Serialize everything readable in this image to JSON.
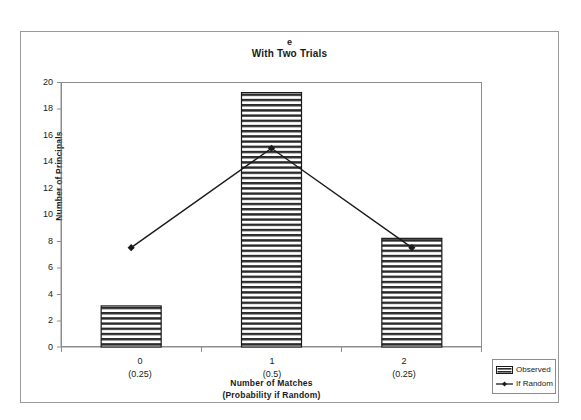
{
  "chart_data": {
    "type": "bar",
    "title": "With Two Trials",
    "panel_label": "e",
    "xlabel": "Number of Matches",
    "xlabel_sub": "(Probability if Random)",
    "ylabel": "Number of Principals",
    "ylim": [
      0,
      20
    ],
    "ytick_step": 2,
    "yticks": [
      0,
      2,
      4,
      6,
      8,
      10,
      12,
      14,
      16,
      18,
      20
    ],
    "grid": false,
    "legend_position": "bottom-right-outside",
    "categories": [
      "0",
      "1",
      "2"
    ],
    "category_sublabels": [
      "(0.25)",
      "(0.5)",
      "(0.25)"
    ],
    "series": [
      {
        "name": "Observed",
        "type": "bar",
        "fill": "horizontal-hatch",
        "values": [
          3.1,
          19.2,
          8.2
        ]
      },
      {
        "name": "If Random",
        "type": "line",
        "marker": "diamond",
        "color": "#1a1a1a",
        "values": [
          7.5,
          15.0,
          7.5
        ]
      }
    ]
  },
  "legend": {
    "items": [
      {
        "label": "Observed",
        "swatch": "hatched-bar-swatch"
      },
      {
        "label": "If Random",
        "swatch": "line-marker-swatch"
      }
    ]
  },
  "colors": {
    "bar_stroke": "#1a1a1a",
    "bar_fill": "#ffffff",
    "hatch": "#2b2b2b",
    "line": "#1a1a1a",
    "axis": "#8d8d8d",
    "frame": "#9a9a9a",
    "text": "#1a1a1a"
  }
}
